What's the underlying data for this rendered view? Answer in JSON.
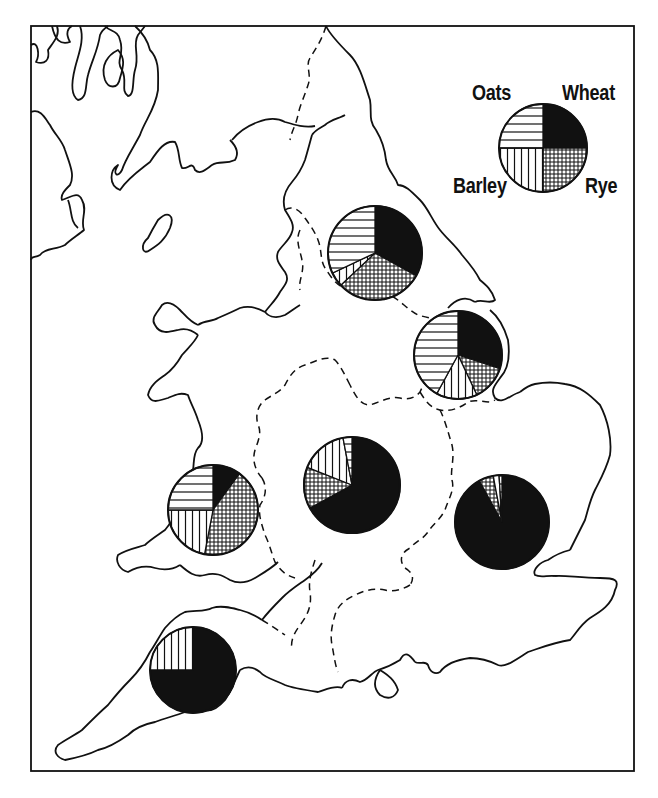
{
  "legend": {
    "title": "Crop key",
    "labels": {
      "oats": "Oats",
      "wheat": "Wheat",
      "barley": "Barley",
      "rye": "Rye"
    },
    "crops": [
      {
        "key": "wheat",
        "name": "Wheat",
        "pattern": "solid-black"
      },
      {
        "key": "rye",
        "name": "Rye",
        "pattern": "crosshatch"
      },
      {
        "key": "barley",
        "name": "Barley",
        "pattern": "vertical-lines"
      },
      {
        "key": "oats",
        "name": "Oats",
        "pattern": "horizontal-lines"
      }
    ]
  },
  "colors": {
    "ink": "#111111",
    "paper": "#ffffff"
  },
  "chart_data": {
    "type": "pie",
    "title": "",
    "series_order": [
      "Wheat",
      "Rye",
      "Barley",
      "Oats"
    ],
    "legend_position": "top-right",
    "pies": [
      {
        "region": "legend",
        "cx": 543,
        "cy": 148,
        "r": 44,
        "values": {
          "Wheat": 25,
          "Rye": 25,
          "Barley": 25,
          "Oats": 25
        }
      },
      {
        "region": "north-east (Yorkshire)",
        "cx": 375,
        "cy": 253,
        "r": 47,
        "values": {
          "Wheat": 33,
          "Rye": 30,
          "Barley": 5,
          "Oats": 32
        }
      },
      {
        "region": "east (Lincolnshire)",
        "cx": 458,
        "cy": 355,
        "r": 44,
        "values": {
          "Wheat": 30,
          "Rye": 13,
          "Barley": 15,
          "Oats": 42
        }
      },
      {
        "region": "midlands",
        "cx": 352,
        "cy": 485,
        "r": 48,
        "values": {
          "Wheat": 67,
          "Rye": 14,
          "Barley": 16,
          "Oats": 3
        }
      },
      {
        "region": "welsh border",
        "cx": 213,
        "cy": 510,
        "r": 45,
        "values": {
          "Wheat": 10,
          "Rye": 43,
          "Barley": 22,
          "Oats": 25
        }
      },
      {
        "region": "south-east",
        "cx": 502,
        "cy": 522,
        "r": 47,
        "values": {
          "Wheat": 92,
          "Rye": 5,
          "Barley": 2,
          "Oats": 1
        }
      },
      {
        "region": "south-west",
        "cx": 193,
        "cy": 670,
        "r": 43,
        "values": {
          "Wheat": 75,
          "Rye": 0,
          "Barley": 25,
          "Oats": 0
        }
      }
    ]
  }
}
